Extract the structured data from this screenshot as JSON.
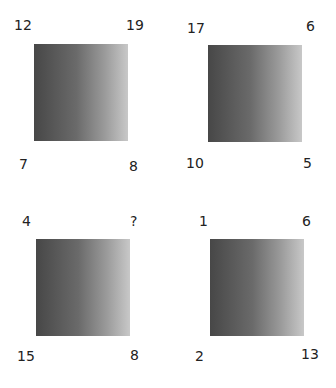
{
  "puzzle": {
    "panels": [
      {
        "top_left": "12",
        "top_right": "19",
        "bottom_left": "7",
        "bottom_right": "8"
      },
      {
        "top_left": "17",
        "top_right": "6",
        "bottom_left": "10",
        "bottom_right": "5"
      },
      {
        "top_left": "4",
        "top_right": "?",
        "bottom_left": "15",
        "bottom_right": "8"
      },
      {
        "top_left": "1",
        "top_right": "6",
        "bottom_left": "2",
        "bottom_right": "13"
      }
    ],
    "square_gradient": {
      "left": "#474747",
      "right": "#c8c8c8"
    }
  }
}
